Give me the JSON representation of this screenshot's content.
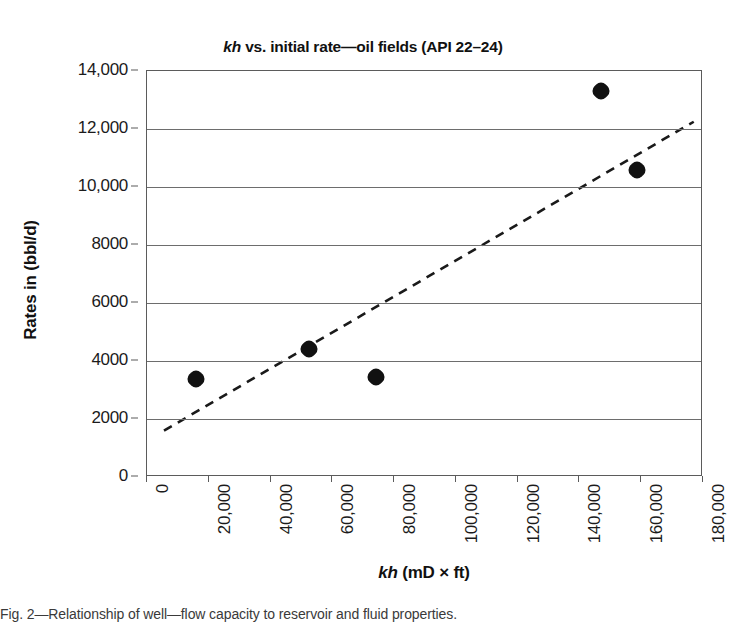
{
  "figure": {
    "title_prefix": "kh",
    "title_rest": " vs. initial rate—oil fields (API 22–24)",
    "title_full": "kh vs. initial rate—oil fields (API 22–24)",
    "x_axis_title_prefix": "kh",
    "x_axis_title_rest": " (mD × ft)",
    "y_axis_title": "Rates in (bbl/d)",
    "caption_partial": "Fig. 2—Relationship of well—flow capacity to reservoir and fluid properties."
  },
  "chart_data": {
    "type": "scatter",
    "title": "kh vs. initial rate—oil fields (API 22–24)",
    "xlabel": "kh (mD × ft)",
    "ylabel": "Rates in (bbl/d)",
    "xlim": [
      0,
      180000
    ],
    "ylim": [
      0,
      14000
    ],
    "grid": true,
    "legend": "none",
    "marker_color": "#111111",
    "trendline_color": "#1a1a1a",
    "x_ticks": [
      0,
      20000,
      40000,
      60000,
      80000,
      100000,
      120000,
      140000,
      160000,
      180000
    ],
    "x_tick_labels": [
      "0",
      "20,000",
      "40,000",
      "60,000",
      "80,000",
      "100,000",
      "120,000",
      "140,000",
      "160,000",
      "180,000"
    ],
    "y_ticks": [
      0,
      2000,
      4000,
      6000,
      8000,
      10000,
      12000,
      14000
    ],
    "y_tick_labels": [
      "0",
      "2000",
      "4000",
      "6000",
      "8000",
      "10,000",
      "12,000",
      "14,000"
    ],
    "points": [
      {
        "x": 16000,
        "y": 3380
      },
      {
        "x": 52500,
        "y": 4420
      },
      {
        "x": 74000,
        "y": 3440
      },
      {
        "x": 147000,
        "y": 13300
      },
      {
        "x": 158500,
        "y": 10600
      }
    ],
    "trendline": {
      "style": "dashed",
      "x_start": 5500,
      "y_start": 1600,
      "x_end": 177000,
      "y_end": 12250
    }
  }
}
